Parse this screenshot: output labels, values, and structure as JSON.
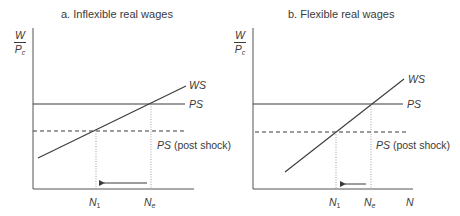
{
  "panels": [
    {
      "title": "a. Inflexible real wages",
      "y_axis_label": {
        "numerator": "W",
        "denominator": "P",
        "denominator_sub": "c"
      },
      "curves": {
        "ws": "WS",
        "ps": "PS",
        "ps_post_shock": "PS",
        "ps_post_shock_suffix": " (post shock)"
      },
      "x_labels": {
        "n1": "N",
        "n1_sub": "1",
        "ne": "N",
        "ne_sub": "e"
      }
    },
    {
      "title": "b. Flexible real wages",
      "y_axis_label": {
        "numerator": "W",
        "denominator": "P",
        "denominator_sub": "c"
      },
      "curves": {
        "ws": "WS",
        "ps": "PS",
        "ps_post_shock": "PS",
        "ps_post_shock_suffix": " (post shock)"
      },
      "x_labels": {
        "n1": "N",
        "n1_sub": "1",
        "ne": "N",
        "ne_sub": "e",
        "axis": "N"
      }
    }
  ],
  "colors": {
    "line": "#3a3a3a",
    "axis": "#555555",
    "guide": "#8a8a8a"
  }
}
